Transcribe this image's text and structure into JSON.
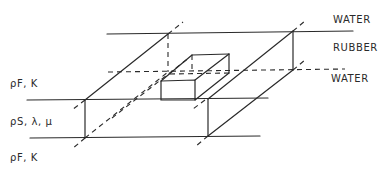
{
  "diagram": {
    "type": "isometric layered slab schematic",
    "layers": [
      {
        "name": "top-medium",
        "label": "WATER"
      },
      {
        "name": "middle-layer",
        "label": "RUBBER"
      },
      {
        "name": "bottom-medium",
        "label": "WATER"
      }
    ],
    "right_labels": {
      "top": "WATER",
      "middle": "RUBBER",
      "bottom": "WATER"
    },
    "left_labels": {
      "top": "ρF, K",
      "middle": "ρS, λ, μ",
      "bottom": "ρF, K"
    },
    "line_color": "#2a2a2a",
    "background": "#ffffff"
  }
}
